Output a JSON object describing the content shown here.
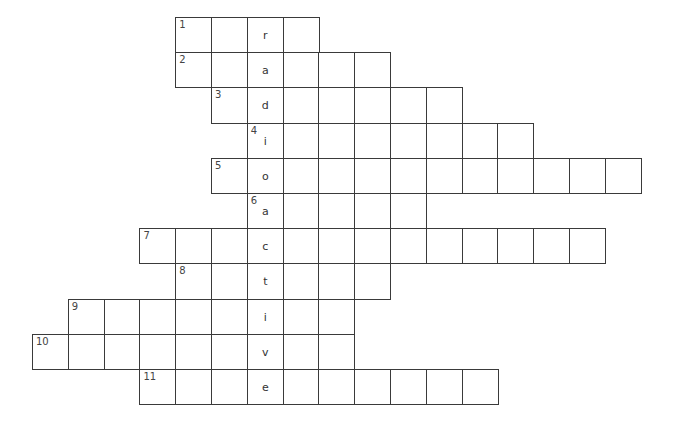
{
  "puzzle": {
    "title": "",
    "vertical_word": "radioactive",
    "key_column": 6,
    "rows": [
      {
        "number": "1",
        "start_col": 4,
        "length": 4,
        "letter": "r"
      },
      {
        "number": "2",
        "start_col": 4,
        "length": 6,
        "letter": "a"
      },
      {
        "number": "3",
        "start_col": 5,
        "length": 7,
        "letter": "d"
      },
      {
        "number": "4",
        "start_col": 6,
        "length": 8,
        "letter": "i"
      },
      {
        "number": "5",
        "start_col": 5,
        "length": 12,
        "letter": "o"
      },
      {
        "number": "6",
        "start_col": 6,
        "length": 5,
        "letter": "a"
      },
      {
        "number": "7",
        "start_col": 3,
        "length": 13,
        "letter": "c"
      },
      {
        "number": "8",
        "start_col": 4,
        "length": 6,
        "letter": "t"
      },
      {
        "number": "9",
        "start_col": 1,
        "length": 8,
        "letter": "i"
      },
      {
        "number": "10",
        "start_col": 0,
        "length": 9,
        "letter": "v"
      },
      {
        "number": "11",
        "start_col": 3,
        "length": 10,
        "letter": "e"
      }
    ]
  },
  "layout": {
    "origin_x": 32,
    "origin_y": 17,
    "cell_w": 35.8,
    "cell_h": 35.2
  },
  "colors": {
    "grid_line": "#3a3a3a",
    "background": "#ffffff"
  }
}
